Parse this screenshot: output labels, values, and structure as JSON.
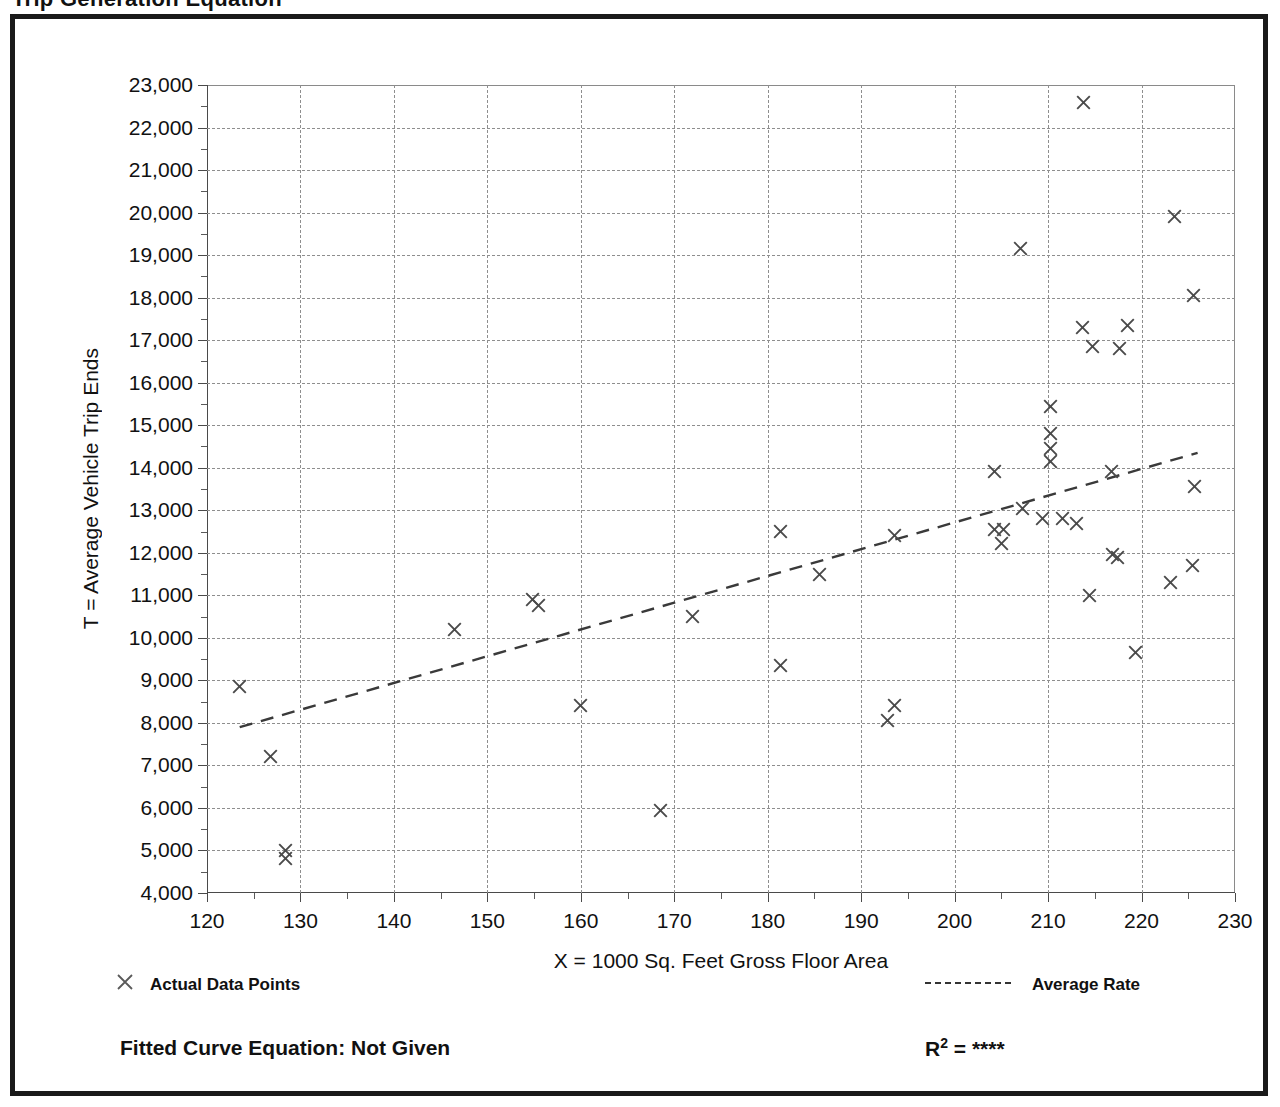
{
  "page": {
    "cut_title": "Trip Generation Equation"
  },
  "legend": {
    "data_points_label": "Actual Data Points",
    "average_rate_label": "Average Rate",
    "data_points_marker": "x-marker-icon",
    "average_rate_marker": "dashed-line-icon"
  },
  "footer": {
    "fitted_curve_label": "Fitted Curve Equation:  Not Given",
    "r2_prefix": "R",
    "r2_sup": "2",
    "r2_value": "= ****"
  },
  "chart_data": {
    "type": "scatter",
    "title": "",
    "xlabel": "X = 1000 Sq. Feet Gross Floor Area",
    "ylabel": "T = Average Vehicle Trip Ends",
    "xlim": [
      120,
      230
    ],
    "ylim": [
      4000,
      23000
    ],
    "xticks": [
      120,
      130,
      140,
      150,
      160,
      170,
      180,
      190,
      200,
      210,
      220,
      230
    ],
    "xtick_labels": [
      "120",
      "130",
      "140",
      "150",
      "160",
      "170",
      "180",
      "190",
      "200",
      "210",
      "220",
      "230"
    ],
    "yticks": [
      4000,
      5000,
      6000,
      7000,
      8000,
      9000,
      10000,
      11000,
      12000,
      13000,
      14000,
      15000,
      16000,
      17000,
      18000,
      19000,
      20000,
      21000,
      22000,
      23000
    ],
    "ytick_labels": [
      "4,000",
      "5,000",
      "6,000",
      "7,000",
      "8,000",
      "9,000",
      "10,000",
      "11,000",
      "12,000",
      "13,000",
      "14,000",
      "15,000",
      "16,000",
      "17,000",
      "18,000",
      "19,000",
      "20,000",
      "21,000",
      "22,000",
      "23,000"
    ],
    "x_minor_step": 5,
    "y_minor_step": 500,
    "grid": true,
    "grid_style": "dotted",
    "legend_position": "below-plot",
    "series": [
      {
        "name": "Actual Data Points",
        "type": "scatter",
        "marker": "x",
        "color": "#4a4a4a",
        "points": [
          [
            123.5,
            8850
          ],
          [
            126.8,
            7200
          ],
          [
            128.4,
            5000
          ],
          [
            128.4,
            4820
          ],
          [
            146.5,
            10200
          ],
          [
            154.8,
            10900
          ],
          [
            155.5,
            10750
          ],
          [
            160.0,
            8400
          ],
          [
            168.5,
            5950
          ],
          [
            172.0,
            10500
          ],
          [
            181.4,
            12500
          ],
          [
            181.4,
            9350
          ],
          [
            185.5,
            11500
          ],
          [
            192.8,
            8050
          ],
          [
            193.6,
            8400
          ],
          [
            193.6,
            12400
          ],
          [
            204.3,
            13900
          ],
          [
            204.3,
            12550
          ],
          [
            205.2,
            12550
          ],
          [
            205.0,
            12220
          ],
          [
            207.0,
            19150
          ],
          [
            207.3,
            13050
          ],
          [
            209.4,
            12800
          ],
          [
            210.3,
            15450
          ],
          [
            210.3,
            14800
          ],
          [
            210.3,
            14450
          ],
          [
            210.3,
            14150
          ],
          [
            211.5,
            12800
          ],
          [
            213.0,
            12700
          ],
          [
            213.8,
            22600
          ],
          [
            213.7,
            17300
          ],
          [
            214.4,
            11000
          ],
          [
            214.7,
            16850
          ],
          [
            216.8,
            13900
          ],
          [
            216.9,
            11950
          ],
          [
            217.4,
            11880
          ],
          [
            218.5,
            17350
          ],
          [
            217.6,
            16800
          ],
          [
            219.3,
            9650
          ],
          [
            223.1,
            11300
          ],
          [
            223.5,
            19900
          ],
          [
            225.6,
            18050
          ],
          [
            225.7,
            13550
          ],
          [
            225.5,
            11700
          ]
        ]
      },
      {
        "name": "Average Rate",
        "type": "line",
        "style": "dashed",
        "color": "#3a3a3a",
        "x": [
          123.5,
          226.0
        ],
        "y": [
          7900,
          14350
        ]
      }
    ]
  }
}
